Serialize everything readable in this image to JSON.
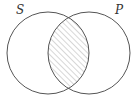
{
  "diagram": {
    "type": "venn",
    "sets": [
      {
        "label": "S",
        "cx": 48,
        "cy": 53,
        "r": 41
      },
      {
        "label": "P",
        "cx": 89,
        "cy": 53,
        "r": 41
      }
    ],
    "shaded_region": "S ∩ P",
    "shading_style": "diagonal-hatch",
    "colors": {
      "outline": "#555555",
      "hatch": "#9a9a9a",
      "background": "#ffffff",
      "label": "#333333"
    }
  },
  "labels": {
    "s": "S",
    "p": "P"
  }
}
